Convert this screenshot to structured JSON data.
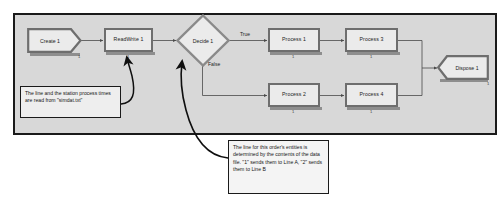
{
  "diagram": {
    "canvas": {
      "background_color": "#d8d8d8",
      "border_color": "#1a1a1a"
    },
    "nodes": [
      {
        "id": "create1",
        "label": "Create 1",
        "shape": "create-pentagon",
        "count": "1"
      },
      {
        "id": "readwrite1",
        "label": "ReadWrite 1",
        "shape": "rectangle",
        "count": "1"
      },
      {
        "id": "decide1",
        "label": "Decide 1",
        "shape": "diamond",
        "count": "1"
      },
      {
        "id": "process1",
        "label": "Process 1",
        "shape": "rectangle",
        "count": "1"
      },
      {
        "id": "process3",
        "label": "Process 3",
        "shape": "rectangle",
        "count": "1"
      },
      {
        "id": "process2",
        "label": "Process 2",
        "shape": "rectangle",
        "count": "1"
      },
      {
        "id": "process4",
        "label": "Process 4",
        "shape": "rectangle",
        "count": "1"
      },
      {
        "id": "dispose1",
        "label": "Dispose 1",
        "shape": "dispose-chevron",
        "count": "1"
      }
    ],
    "edge_labels": {
      "decide_true": "True",
      "decide_false": "False"
    },
    "callouts": [
      {
        "id": "callout-simdat",
        "text": "The line and the station process times are read from \"simdat.txt\""
      },
      {
        "id": "callout-line-routing",
        "text": "The line for this order's entities is determined by the contents of the data file. \"1\" sends them to Line A, \"2\" sends them to Line B"
      }
    ]
  }
}
